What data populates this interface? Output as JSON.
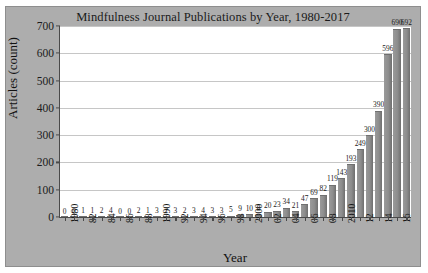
{
  "chart_data": {
    "type": "bar",
    "title": "Mindfulness Journal Publications by Year, 1980-2017",
    "xlabel": "Year",
    "ylabel": "Articles (count)",
    "ylim": [
      0,
      700
    ],
    "yticks": [
      0,
      100,
      200,
      300,
      400,
      500,
      600,
      700
    ],
    "grid": true,
    "legend": "none",
    "categories": [
      "1980",
      "1981",
      "1982",
      "1983",
      "1984",
      "1985",
      "1986",
      "1987",
      "1988",
      "1989",
      "1990",
      "1991",
      "1992",
      "1993",
      "1994",
      "1995",
      "1996",
      "1997",
      "1998",
      "1999",
      "2000",
      "2001",
      "2002",
      "2003",
      "2004",
      "2005",
      "2006",
      "2007",
      "2008",
      "2009",
      "2010",
      "2011",
      "2012",
      "2013",
      "2014",
      "2015",
      "2016",
      "2017"
    ],
    "tick_labels": [
      "1980",
      "",
      "82",
      "",
      "84",
      "",
      "86",
      "",
      "88",
      "",
      "1990",
      "",
      "92",
      "",
      "94",
      "",
      "96",
      "",
      "98",
      "",
      "2000",
      "",
      "02",
      "",
      "04",
      "",
      "06",
      "",
      "08",
      "",
      "2010",
      "",
      "12",
      "",
      "14",
      "",
      "16",
      ""
    ],
    "values": [
      0,
      0,
      1,
      1,
      2,
      4,
      0,
      0,
      2,
      1,
      3,
      2,
      3,
      2,
      3,
      4,
      3,
      3,
      5,
      9,
      10,
      8,
      20,
      23,
      34,
      21,
      47,
      69,
      82,
      119,
      143,
      193,
      249,
      300,
      390,
      596,
      690,
      692
    ],
    "bar_color": "#8d8d8d",
    "plot_background": "#ffffff",
    "figure_background": "#adadad",
    "axis_color": "#4a4a4a",
    "gridline_color": "#c6c6c6",
    "text_color": "#1b1b1b"
  }
}
